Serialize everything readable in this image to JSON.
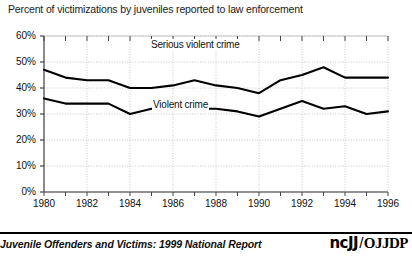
{
  "chart_data": {
    "type": "line",
    "title": "Percent of victimizations by juveniles reported to law enforcement",
    "xlabel": "",
    "ylabel": "",
    "grid": true,
    "legend_position": "inline-labels",
    "xlim": [
      1980,
      1996
    ],
    "ylim": [
      0,
      60
    ],
    "ytick_labels": [
      "0%",
      "10%",
      "20%",
      "30%",
      "40%",
      "50%",
      "60%"
    ],
    "ytick_values": [
      0,
      10,
      20,
      30,
      40,
      50,
      60
    ],
    "xtick_labels": [
      "1980",
      "1982",
      "1984",
      "1986",
      "1988",
      "1990",
      "1992",
      "1994",
      "1996"
    ],
    "xtick_values": [
      1980,
      1982,
      1984,
      1986,
      1988,
      1990,
      1992,
      1994,
      1996
    ],
    "x": [
      1980,
      1981,
      1982,
      1983,
      1984,
      1985,
      1986,
      1987,
      1988,
      1989,
      1990,
      1991,
      1992,
      1993,
      1994,
      1995,
      1996
    ],
    "series": [
      {
        "name": "Serious violent crime",
        "values": [
          47,
          44,
          43,
          43,
          40,
          40,
          41,
          43,
          41,
          40,
          38,
          43,
          45,
          48,
          44,
          44,
          44
        ]
      },
      {
        "name": "Violent crime",
        "values": [
          36,
          34,
          34,
          34,
          30,
          32,
          33,
          32,
          32,
          31,
          29,
          32,
          35,
          32,
          33,
          30,
          31
        ]
      }
    ],
    "annotations": [
      {
        "text": "Serious violent crime",
        "series": "Serious violent crime"
      },
      {
        "text": "Violent crime",
        "series": "Violent crime"
      }
    ]
  },
  "footer": {
    "citation": "Juvenile Offenders and Victims: 1999 National Report",
    "logo_primary": "ncJJ",
    "logo_separator": "/",
    "logo_secondary": "OJJDP"
  },
  "colors": {
    "line": "#000000",
    "grid": "#b9b9b9",
    "axis": "#444444",
    "text": "#111111",
    "background": "#ffffff"
  }
}
